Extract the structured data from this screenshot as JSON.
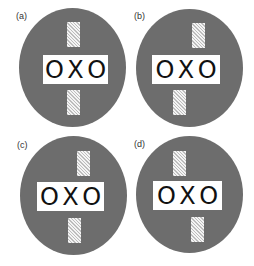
{
  "figure": {
    "panels": [
      {
        "label": "(a)",
        "text": "OXO",
        "layout": "stripes aligned, centered"
      },
      {
        "label": "(b)",
        "text": "OXO",
        "layout": "top stripe shifted right, bottom stripe shifted left"
      },
      {
        "label": "(c)",
        "text": "OXO",
        "layout": "top stripe shifted right, bottom stripe shifted left, plate shifted left"
      },
      {
        "label": "(d)",
        "text": "OXO",
        "layout": "top stripe shifted left, bottom stripe shifted right"
      }
    ],
    "colors": {
      "disc": "#6d6d6d",
      "plate": "#ffffff",
      "text": "#111111",
      "stripe_hatch": "#bdbdbd"
    }
  }
}
